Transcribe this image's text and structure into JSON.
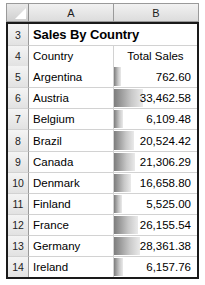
{
  "spreadsheet": {
    "select_all_icon": "select-all-triangle-icon",
    "columns": [
      {
        "letter": "A"
      },
      {
        "letter": "B"
      }
    ],
    "title_row": {
      "row_number": "3",
      "title": "Sales By Country"
    },
    "header_row": {
      "row_number": "4",
      "country_label": "Country",
      "total_sales_label": "Total Sales"
    },
    "rows": [
      {
        "row_number": "5",
        "country": "Argentina",
        "total_sales": "762.60",
        "value": 762.6,
        "bar_pct": 8
      },
      {
        "row_number": "6",
        "country": "Austria",
        "total_sales": "33,462.58",
        "value": 33462.58,
        "bar_pct": 35
      },
      {
        "row_number": "7",
        "country": "Belgium",
        "total_sales": "6,109.48",
        "value": 6109.48,
        "bar_pct": 11
      },
      {
        "row_number": "8",
        "country": "Brazil",
        "total_sales": "20,524.42",
        "value": 20524.42,
        "bar_pct": 24
      },
      {
        "row_number": "9",
        "country": "Canada",
        "total_sales": "21,306.29",
        "value": 21306.29,
        "bar_pct": 25
      },
      {
        "row_number": "10",
        "country": "Denmark",
        "total_sales": "16,658.80",
        "value": 16658.8,
        "bar_pct": 20
      },
      {
        "row_number": "11",
        "country": "Finland",
        "total_sales": "5,525.00",
        "value": 5525.0,
        "bar_pct": 10
      },
      {
        "row_number": "12",
        "country": "France",
        "total_sales": "26,155.54",
        "value": 26155.54,
        "bar_pct": 29
      },
      {
        "row_number": "13",
        "country": "Germany",
        "total_sales": "28,361.38",
        "value": 28361.38,
        "bar_pct": 31
      },
      {
        "row_number": "14",
        "country": "Ireland",
        "total_sales": "6,157.76",
        "value": 6157.76,
        "bar_pct": 11
      }
    ],
    "colors": {
      "data_bar": "#7d7d7d",
      "header_background": "#e2e2e2",
      "grid_line": "#d2d2d2",
      "frame": "#1a1a1a"
    }
  }
}
